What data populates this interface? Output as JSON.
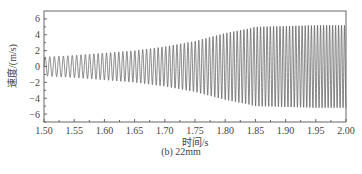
{
  "chart_data": {
    "type": "line",
    "title": "",
    "caption": "(b)  22mm",
    "xlabel": "时间/s",
    "ylabel": "速度/(m/s)",
    "xlim": [
      1.5,
      2.0
    ],
    "ylim": [
      -7,
      7
    ],
    "xticks": [
      "1.50",
      "1.55",
      "1.60",
      "1.65",
      "1.70",
      "1.75",
      "1.80",
      "1.85",
      "1.90",
      "1.95",
      "2.00"
    ],
    "yticks": [
      "6",
      "4",
      "2",
      "0",
      "-2",
      "-4",
      "-6"
    ],
    "grid": false,
    "legend": null,
    "series": [
      {
        "name": "velocity",
        "color": "#555555",
        "description": "oscillating signal, amplitude envelope and frequency",
        "envelope_t": [
          1.5,
          1.55,
          1.6,
          1.65,
          1.7,
          1.75,
          1.8,
          1.84,
          1.85,
          1.9,
          1.95,
          2.0
        ],
        "envelope_amp": [
          1.2,
          1.4,
          1.7,
          2.0,
          2.5,
          3.2,
          4.2,
          4.8,
          5.0,
          5.1,
          5.2,
          5.2
        ],
        "freq_start_hz": 130,
        "freq_end_hz": 205
      }
    ]
  }
}
